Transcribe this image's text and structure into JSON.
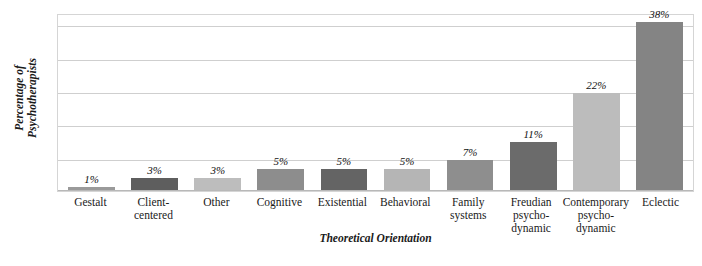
{
  "chart_data": {
    "type": "bar",
    "title": "",
    "xlabel": "Theoretical Orientation",
    "ylabel": "Percentage of Psychotherapists",
    "ylabel_lines": [
      "Percentage of",
      "Psychotherapists"
    ],
    "categories": [
      "Gestalt",
      "Client-centered",
      "Other",
      "Cognitive",
      "Existential",
      "Behavioral",
      "Family systems",
      "Freudian psycho-dynamic",
      "Contemporary psycho-dynamic",
      "Eclectic"
    ],
    "category_label_lines": [
      [
        "Gestalt"
      ],
      [
        "Client-",
        "centered"
      ],
      [
        "Other"
      ],
      [
        "Cognitive"
      ],
      [
        "Existential"
      ],
      [
        "Behavioral"
      ],
      [
        "Family",
        "systems"
      ],
      [
        "Freudian",
        "psycho-",
        "dynamic"
      ],
      [
        "Contemporary",
        "psycho-",
        "dynamic"
      ],
      [
        "Eclectic"
      ]
    ],
    "values": [
      1,
      3,
      3,
      5,
      5,
      5,
      7,
      11,
      22,
      38
    ],
    "value_labels": [
      "1%",
      "3%",
      "3%",
      "5%",
      "5%",
      "5%",
      "7%",
      "11%",
      "22%",
      "38%"
    ],
    "bar_colors": [
      "#9a9a9a",
      "#5e5e5e",
      "#bdbdbd",
      "#8d8d8d",
      "#646464",
      "#b5b5b5",
      "#8e8e8e",
      "#6b6b6b",
      "#bcbcbc",
      "#848484"
    ],
    "ylim": [
      0,
      40
    ],
    "grid": true,
    "gridline_values": [
      7.5,
      15,
      22.5,
      30,
      37.5
    ],
    "y_tick_labels": [],
    "legend": "none",
    "plot_border_color": "#d5d5d5",
    "gridline_color": "#cfcfcf",
    "background_color": "#ffffff"
  }
}
